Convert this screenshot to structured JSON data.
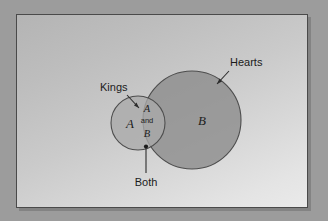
{
  "figure": {
    "type": "venn-diagram",
    "title": "",
    "panel": {
      "background_top_color": "#b4b4b4",
      "background_bottom_color": "#eaeaea",
      "border_color": "#4a4a4a",
      "outer_background_color": "#9c9c9c"
    },
    "sets": [
      {
        "id": "A",
        "symbol": "A",
        "callout": "Kings",
        "fill_color": "#a9a9a9",
        "stroke_color": "#4d4d4d",
        "cx": 137,
        "cy": 122,
        "r": 27
      },
      {
        "id": "B",
        "symbol": "B",
        "callout": "Hearts",
        "fill_color": "#8e8e8e",
        "stroke_color": "#4d4d4d",
        "cx": 191,
        "cy": 119,
        "r": 49
      }
    ],
    "intersection": {
      "line1": "A",
      "line2": "and",
      "line3": "B",
      "callout": "Both"
    },
    "callouts": [
      {
        "id": "kings",
        "text": "Kings",
        "x": 99,
        "y": 89
      },
      {
        "id": "hearts",
        "text": "Hearts",
        "x": 213,
        "y": 61
      },
      {
        "id": "both",
        "text": "Both",
        "x": 130,
        "y": 177
      }
    ]
  }
}
